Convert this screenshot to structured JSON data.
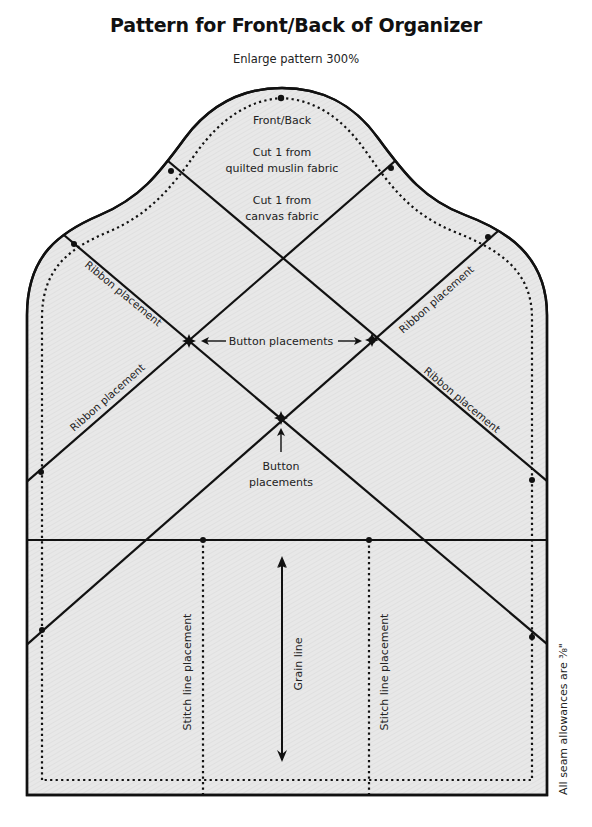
{
  "header": {
    "title": "Pattern for Front/Back of Organizer",
    "subtitle": "Enlarge pattern 300%"
  },
  "pattern": {
    "piece_name": "Front/Back",
    "cut_instructions": [
      {
        "line1": "Cut 1 from",
        "line2": "quilted muslin fabric"
      },
      {
        "line1": "Cut 1 from",
        "line2": "canvas fabric"
      }
    ],
    "labels": {
      "ribbon_upper_left": "Ribbon placement",
      "ribbon_lower_left": "Ribbon placement",
      "ribbon_upper_right": "Ribbon placement",
      "ribbon_lower_right": "Ribbon placement",
      "button_placements_horizontal": "Button placements",
      "button_placements_lower_line1": "Button",
      "button_placements_lower_line2": "placements",
      "stitch_line_left": "Stitch line placement",
      "stitch_line_right": "Stitch line placement",
      "grain_line": "Grain line"
    },
    "footnote": "All seam allowances are ³⁄₈\"",
    "colors": {
      "fabric_fill": "#e6e6e6",
      "outline": "#111111",
      "text": "#222222"
    }
  }
}
